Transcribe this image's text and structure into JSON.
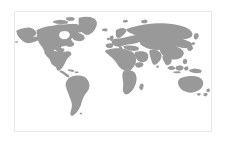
{
  "figure": {
    "type": "map",
    "title": "",
    "projection": "equirectangular",
    "background_color": "#ffffff",
    "land_color": "#999999",
    "ocean_color": "#ffffff",
    "border_color": "#e8e8e8",
    "frame": {
      "left": 14,
      "top": 11,
      "width": 198,
      "height": 121
    },
    "extent": {
      "lon_min": -180,
      "lon_max": 180,
      "lat_min": -58,
      "lat_max": 84
    },
    "graticule_visible": false,
    "labels_visible": false,
    "legend_visible": false,
    "regions": [
      {
        "name": "North America",
        "visible": true
      },
      {
        "name": "Greenland",
        "visible": true
      },
      {
        "name": "South America",
        "visible": true
      },
      {
        "name": "Europe",
        "visible": true
      },
      {
        "name": "Africa",
        "visible": true
      },
      {
        "name": "Asia",
        "visible": true
      },
      {
        "name": "Australia",
        "visible": true
      },
      {
        "name": "Indonesia",
        "visible": true
      },
      {
        "name": "New Zealand",
        "visible": true
      },
      {
        "name": "Japan",
        "visible": true
      },
      {
        "name": "Madagascar",
        "visible": true
      },
      {
        "name": "British Isles",
        "visible": true
      },
      {
        "name": "Antarctica",
        "visible": false
      }
    ]
  }
}
